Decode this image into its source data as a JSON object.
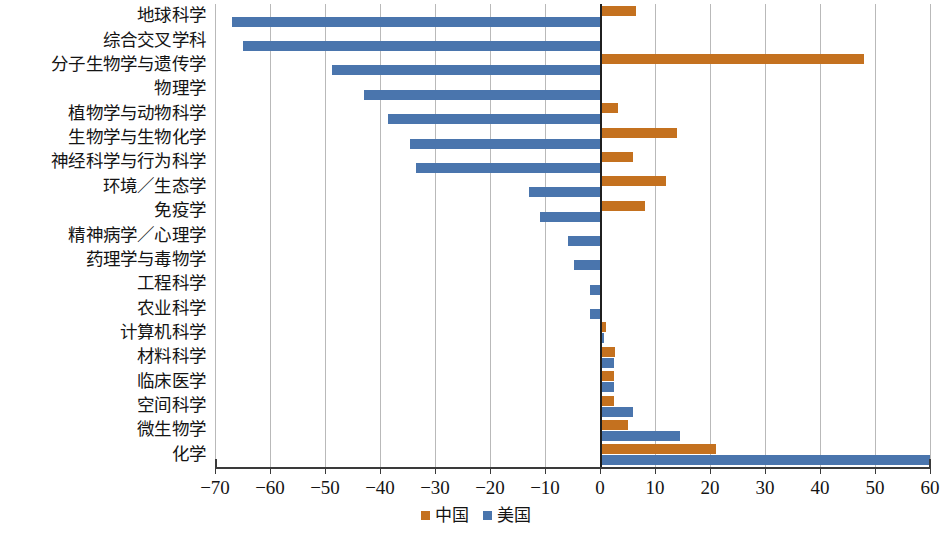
{
  "chart_data": {
    "type": "bar",
    "orientation": "horizontal",
    "title": "",
    "xlabel": "",
    "ylabel": "",
    "xlim": [
      -70,
      60
    ],
    "xticks": [
      "−70",
      "−60",
      "−50",
      "−40",
      "−30",
      "−20",
      "−10",
      "0",
      "10",
      "20",
      "30",
      "40",
      "50",
      "60"
    ],
    "xtick_values": [
      -70,
      -60,
      -50,
      -40,
      -30,
      -20,
      -10,
      0,
      10,
      20,
      30,
      40,
      50,
      60
    ],
    "grid": true,
    "legend_position": "bottom-center",
    "categories": [
      "地球科学",
      "综合交叉学科",
      "分子生物学与遗传学",
      "物理学",
      "植物学与动物科学",
      "生物学与生物化学",
      "神经科学与行为科学",
      "环境／生态学",
      "免疫学",
      "精神病学／心理学",
      "药理学与毒物学",
      "工程科学",
      "农业科学",
      "计算机科学",
      "材料科学",
      "临床医学",
      "空间科学",
      "微生物学",
      "化学"
    ],
    "series": [
      {
        "name": "中国",
        "color": "#c4711f",
        "values": [
          6.5,
          0.4,
          48.0,
          0.0,
          3.3,
          14.0,
          6.0,
          12.0,
          8.2,
          0.0,
          0.0,
          0.0,
          0.0,
          1.0,
          2.8,
          2.5,
          2.5,
          5.0,
          21.0
        ]
      },
      {
        "name": "美国",
        "color": "#4a75ad",
        "values": [
          -67.0,
          -65.0,
          -48.7,
          -43.0,
          -38.5,
          -34.5,
          -33.5,
          -13.0,
          -11.0,
          -5.8,
          -4.7,
          -1.8,
          -1.8,
          0.8,
          2.5,
          2.5,
          6.0,
          14.5,
          60.0
        ]
      }
    ],
    "legend": [
      {
        "label": "中国",
        "color": "#c4711f",
        "swatch": "legend-swatch-cn"
      },
      {
        "label": "美国",
        "color": "#4a75ad",
        "swatch": "legend-swatch-us"
      }
    ]
  }
}
